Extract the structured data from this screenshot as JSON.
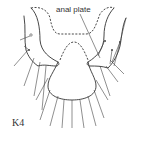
{
  "figure": {
    "annotation_label": "anal plate",
    "specimen_label": "K4"
  }
}
